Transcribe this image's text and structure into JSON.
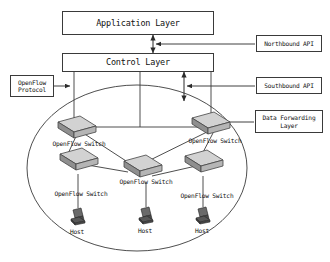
{
  "diagram": {
    "type": "network-architecture-diagram",
    "background_color": "#ffffff",
    "line_color": "#3a3a3a",
    "text_color": "#111111",
    "switch_fill": "#c9c9c9",
    "host_fill": "#555555"
  },
  "layers": {
    "application": {
      "label": "Application Layer"
    },
    "control": {
      "label": "Control Layer"
    },
    "data_forwarding": {
      "label_line1": "Data Forwarding",
      "label_line2": "Layer"
    }
  },
  "annotations": {
    "northbound": {
      "label": "Northbound API"
    },
    "southbound": {
      "label": "Southbound API"
    },
    "openflow_protocol": {
      "label_line1": "OpenFlow",
      "label_line2": "Protocol"
    }
  },
  "switches": [
    {
      "id": "sw-top-left",
      "label": "OpenFlow Switch"
    },
    {
      "id": "sw-top-right",
      "label": "OpenFlow Switch"
    },
    {
      "id": "sw-center",
      "label": "OpenFlow Switch"
    },
    {
      "id": "sw-bottom-left",
      "label": "OpenFlow Switch"
    },
    {
      "id": "sw-bottom-right",
      "label": "OpenFlow Switch"
    }
  ],
  "hosts": [
    {
      "id": "host-left",
      "label": "Host"
    },
    {
      "id": "host-center",
      "label": "Host"
    },
    {
      "id": "host-right",
      "label": "Host"
    }
  ]
}
